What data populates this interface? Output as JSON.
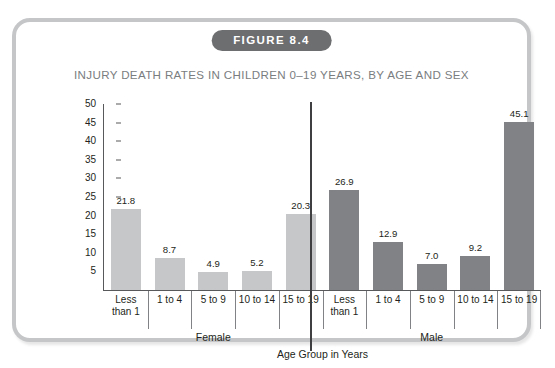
{
  "figure": {
    "badge_label": "FIGURE 8.4",
    "title": "INJURY DEATH RATES IN CHILDREN 0–19 YEARS, BY AGE AND SEX",
    "badge_color": "#6d6e70",
    "border_color": "#c4c6c8",
    "title_color": "#7a7d80"
  },
  "chart_data": {
    "type": "bar",
    "title": "INJURY DEATH RATES IN CHILDREN 0–19 YEARS, BY AGE AND SEX",
    "xlabel": "Age Group in Years",
    "ylabel": "Death Rate Per 100,000 Population",
    "ylim": [
      0,
      50
    ],
    "yticks": [
      50,
      45,
      40,
      35,
      30,
      25,
      20,
      15,
      10,
      5
    ],
    "grid": false,
    "legend": "none",
    "categories": [
      "Less than 1",
      "1 to 4",
      "5 to 9",
      "10 to 14",
      "15 to 19"
    ],
    "groups": [
      "Female",
      "Male"
    ],
    "series": [
      {
        "name": "Female",
        "color": "#c6c7c9",
        "values": [
          21.8,
          8.7,
          4.9,
          5.2,
          20.3
        ],
        "labels": [
          "21.8",
          "8.7",
          "4.9",
          "5.2",
          "20.3"
        ]
      },
      {
        "name": "Male",
        "color": "#808285",
        "values": [
          26.9,
          12.9,
          7.0,
          9.2,
          45.1
        ],
        "labels": [
          "26.9",
          "12.9",
          "7.0",
          "9.2",
          "45.1"
        ]
      }
    ]
  }
}
